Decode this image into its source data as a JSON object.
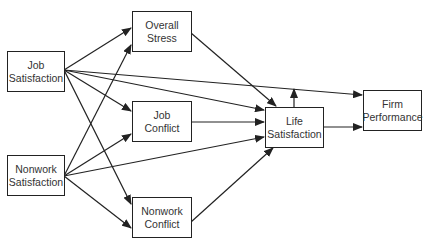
{
  "diagram": {
    "type": "path-model",
    "colors": {
      "stroke": "#222222",
      "text": "#333333",
      "background": "#ffffff"
    },
    "nodes": [
      {
        "id": "job_satisfaction",
        "line1": "Job",
        "line2": "Satisfaction"
      },
      {
        "id": "nonwork_satisfaction",
        "line1": "Nonwork",
        "line2": "Satisfaction"
      },
      {
        "id": "overall_stress",
        "line1": "Overall",
        "line2": "Stress"
      },
      {
        "id": "job_conflict",
        "line1": "Job",
        "line2": "Conflict"
      },
      {
        "id": "nonwork_conflict",
        "line1": "Nonwork",
        "line2": "Conflict"
      },
      {
        "id": "life_satisfaction",
        "line1": "Life",
        "line2": "Satisfaction"
      },
      {
        "id": "firm_performance",
        "line1": "Firm",
        "line2": "Performance"
      }
    ],
    "edges": [
      {
        "from": "job_satisfaction",
        "to": "overall_stress"
      },
      {
        "from": "job_satisfaction",
        "to": "job_conflict"
      },
      {
        "from": "job_satisfaction",
        "to": "nonwork_conflict"
      },
      {
        "from": "job_satisfaction",
        "to": "life_satisfaction"
      },
      {
        "from": "job_satisfaction",
        "to": "firm_performance"
      },
      {
        "from": "nonwork_satisfaction",
        "to": "overall_stress"
      },
      {
        "from": "nonwork_satisfaction",
        "to": "job_conflict"
      },
      {
        "from": "nonwork_satisfaction",
        "to": "nonwork_conflict"
      },
      {
        "from": "nonwork_satisfaction",
        "to": "life_satisfaction"
      },
      {
        "from": "overall_stress",
        "to": "life_satisfaction"
      },
      {
        "from": "job_conflict",
        "to": "life_satisfaction"
      },
      {
        "from": "nonwork_conflict",
        "to": "life_satisfaction"
      },
      {
        "from": "life_satisfaction",
        "to": "firm_performance"
      },
      {
        "from": "life_satisfaction",
        "to": "edge:job_satisfaction->firm_performance",
        "kind": "moderation"
      }
    ]
  }
}
